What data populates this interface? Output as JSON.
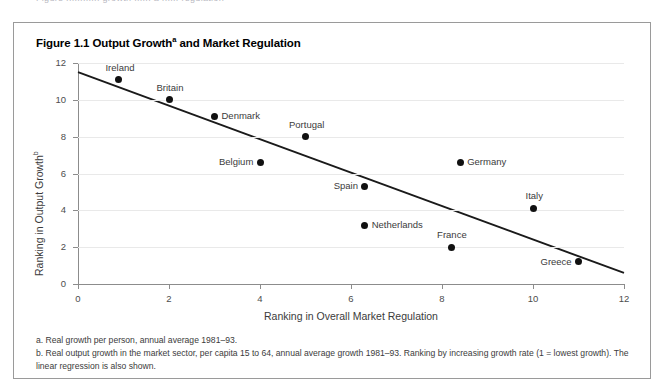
{
  "page": {
    "cutoff_text": "Figure ............ growth ...... a ...... regulation"
  },
  "figure": {
    "title_main": "Figure 1.1 Output Growth",
    "title_sup": "a",
    "title_rest": " and Market Regulation",
    "notes": [
      "a. Real growth per person, annual average 1981–93.",
      "b. Real output growth in the market sector, per capita 15 to 64, annual average growth 1981–93. Ranking by increasing growth rate (1 = lowest growth). The linear regression is also shown."
    ]
  },
  "chart_data": {
    "type": "scatter",
    "xlabel": "Ranking in Overall Market Regulation",
    "ylabel": "Ranking in Output Growth",
    "ylabel_sup": "b",
    "xlim": [
      0,
      12
    ],
    "ylim": [
      0,
      12
    ],
    "xticks": [
      "0",
      "2",
      "4",
      "6",
      "8",
      "10",
      "12"
    ],
    "xtick_values": [
      0,
      2,
      4,
      6,
      8,
      10,
      12
    ],
    "yticks": [
      "0",
      "2",
      "4",
      "6",
      "8",
      "10",
      "12"
    ],
    "ytick_values": [
      0,
      2,
      4,
      6,
      8,
      10,
      12
    ],
    "grid": "horizontal",
    "legend": "none",
    "point_color": "#111111",
    "line_color": "#1a1a1a",
    "grid_color": "#e9e9e9",
    "axis_color": "#8c8c8c",
    "points": [
      {
        "label": "Ireland",
        "x": 0.9,
        "y": 11.1,
        "label_pos": "above"
      },
      {
        "label": "Britain",
        "x": 2.0,
        "y": 10.0,
        "label_pos": "above"
      },
      {
        "label": "Denmark",
        "x": 3.0,
        "y": 9.1,
        "label_pos": "right"
      },
      {
        "label": "Belgium",
        "x": 4.0,
        "y": 6.6,
        "label_pos": "left"
      },
      {
        "label": "Portugal",
        "x": 5.0,
        "y": 8.0,
        "label_pos": "above"
      },
      {
        "label": "Spain",
        "x": 6.3,
        "y": 5.3,
        "label_pos": "left"
      },
      {
        "label": "Netherlands",
        "x": 6.3,
        "y": 3.2,
        "label_pos": "right"
      },
      {
        "label": "Germany",
        "x": 8.4,
        "y": 6.6,
        "label_pos": "right"
      },
      {
        "label": "France",
        "x": 8.2,
        "y": 2.0,
        "label_pos": "above"
      },
      {
        "label": "Italy",
        "x": 10.0,
        "y": 4.1,
        "label_pos": "above"
      },
      {
        "label": "Greece",
        "x": 11.0,
        "y": 1.2,
        "label_pos": "left"
      }
    ],
    "regression": {
      "x0": 0.0,
      "y0": 11.5,
      "x1": 12.0,
      "y1": 0.6
    }
  }
}
